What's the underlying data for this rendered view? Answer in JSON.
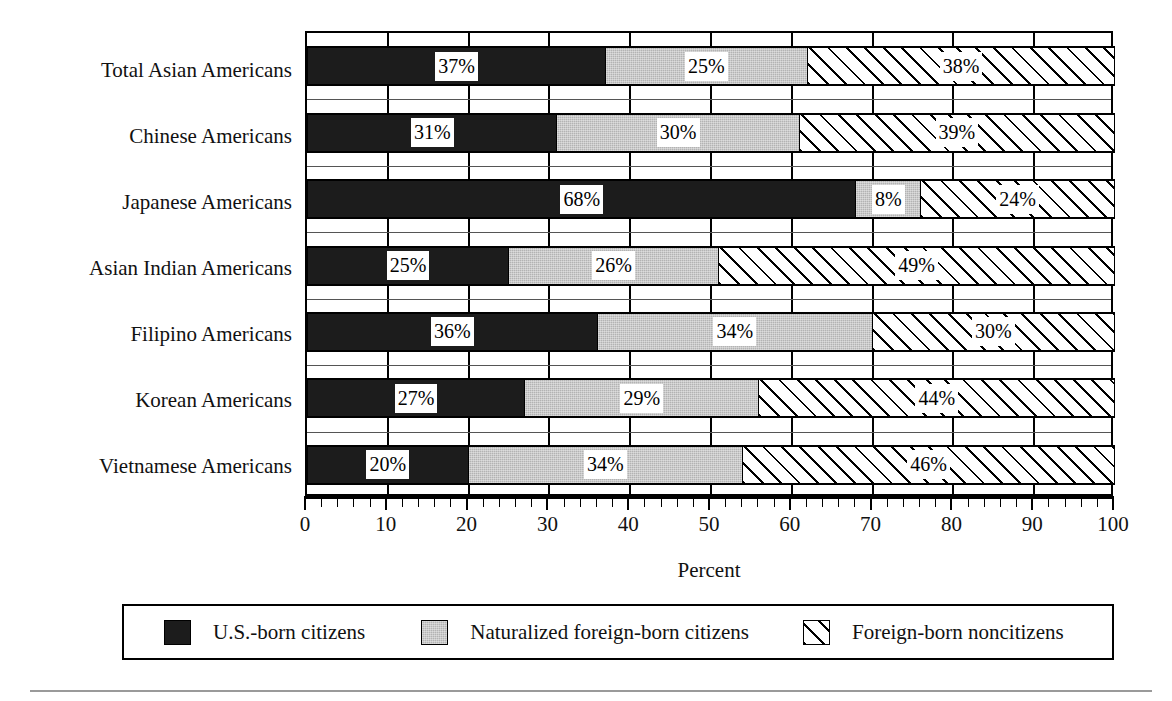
{
  "chart_data": {
    "type": "bar",
    "subtype": "horizontal-stacked-100pct",
    "title": "",
    "xlabel": "Percent",
    "ylabel": "",
    "xlim": [
      0,
      100
    ],
    "xticks": [
      0,
      10,
      20,
      30,
      40,
      50,
      60,
      70,
      80,
      90,
      100
    ],
    "xtick_labels": [
      "0",
      "10",
      "20",
      "30",
      "40",
      "50",
      "60",
      "70",
      "80",
      "90",
      "100"
    ],
    "minor_tick_step": 2,
    "grid": "vertical-and-horizontal",
    "legend_position": "bottom",
    "value_suffix": "%",
    "categories": [
      "Total Asian Americans",
      "Chinese Americans",
      "Japanese Americans",
      "Asian Indian Americans",
      "Filipino Americans",
      "Korean Americans",
      "Vietnamese Americans"
    ],
    "series": [
      {
        "name": "U.S.-born citizens",
        "fill": "solid-black",
        "color": "#1c1c1c",
        "values": [
          37,
          31,
          68,
          25,
          36,
          27,
          20
        ],
        "labels": [
          "37%",
          "31%",
          "68%",
          "25%",
          "36%",
          "27%",
          "20%"
        ]
      },
      {
        "name": "Naturalized foreign-born citizens",
        "fill": "solid-gray",
        "color": "#b3b3b3",
        "values": [
          25,
          30,
          8,
          26,
          34,
          29,
          34
        ],
        "labels": [
          "25%",
          "30%",
          "8%",
          "26%",
          "34%",
          "29%",
          "34%"
        ]
      },
      {
        "name": "Foreign-born noncitizens",
        "fill": "diagonal-hatch",
        "color": "#ffffff",
        "values": [
          38,
          39,
          24,
          49,
          30,
          44,
          46
        ],
        "labels": [
          "38%",
          "39%",
          "24%",
          "49%",
          "30%",
          "44%",
          "46%"
        ]
      }
    ]
  },
  "axis": {
    "x_title": "Percent"
  },
  "legend": {
    "items": [
      {
        "label": "U.S.-born citizens",
        "swatch": "black-swatch"
      },
      {
        "label": "Naturalized foreign-born citizens",
        "swatch": "gray-swatch"
      },
      {
        "label": "Foreign-born noncitizens",
        "swatch": "hatched-swatch"
      }
    ]
  }
}
